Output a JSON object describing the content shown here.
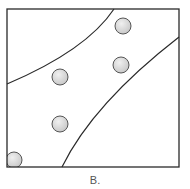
{
  "figure": {
    "label": "B.",
    "colors": {
      "stroke": "#2a2a2a",
      "circle_fill": "#d4d4d4",
      "circle_highlight": "#f0f0f0",
      "background": "#ffffff"
    },
    "box": {
      "x": 7,
      "y": 9,
      "width": 172,
      "height": 158
    },
    "curves": [
      {
        "name": "upper-boundary",
        "d": "M7,84 C40,70 90,45 114,9"
      },
      {
        "name": "lower-boundary",
        "d": "M62,167 C85,120 130,75 179,37"
      }
    ],
    "circles": [
      {
        "cx": 123,
        "cy": 26,
        "r": 8
      },
      {
        "cx": 121,
        "cy": 65,
        "r": 8
      },
      {
        "cx": 60,
        "cy": 77,
        "r": 8
      },
      {
        "cx": 60,
        "cy": 124,
        "r": 8
      },
      {
        "cx": 14,
        "cy": 160,
        "r": 8
      }
    ]
  }
}
